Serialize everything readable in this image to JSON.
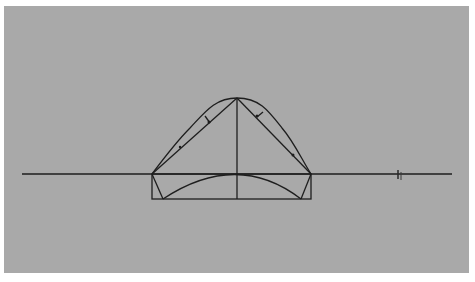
{
  "canvas": {
    "background": "#a9a9a9",
    "page_background": "#ffffff",
    "stroke_color": "#1e1e1e"
  },
  "diagram": {
    "baseline": {
      "x1": 22,
      "y1": 174,
      "x2": 452,
      "y2": 174
    },
    "apex": {
      "x": 237,
      "y": 98
    },
    "axis": {
      "x": 237,
      "y_top": 98,
      "y_bottom": 199
    },
    "triangle": {
      "left": {
        "x": 152,
        "y": 174
      },
      "right": {
        "x": 311,
        "y": 174
      }
    },
    "box": {
      "x": 152,
      "y": 174,
      "width": 159,
      "height": 25
    },
    "lower_diagonals": [
      {
        "x1": 152,
        "y1": 174,
        "x2": 163,
        "y2": 199
      },
      {
        "x1": 311,
        "y1": 174,
        "x2": 301,
        "y2": 199
      }
    ],
    "lower_arc": {
      "start": {
        "x": 163,
        "y": 199
      },
      "peak": {
        "x": 237,
        "y": 174
      },
      "end": {
        "x": 301,
        "y": 199
      }
    },
    "cursor_mark": {
      "x": 400,
      "y": 176
    }
  }
}
